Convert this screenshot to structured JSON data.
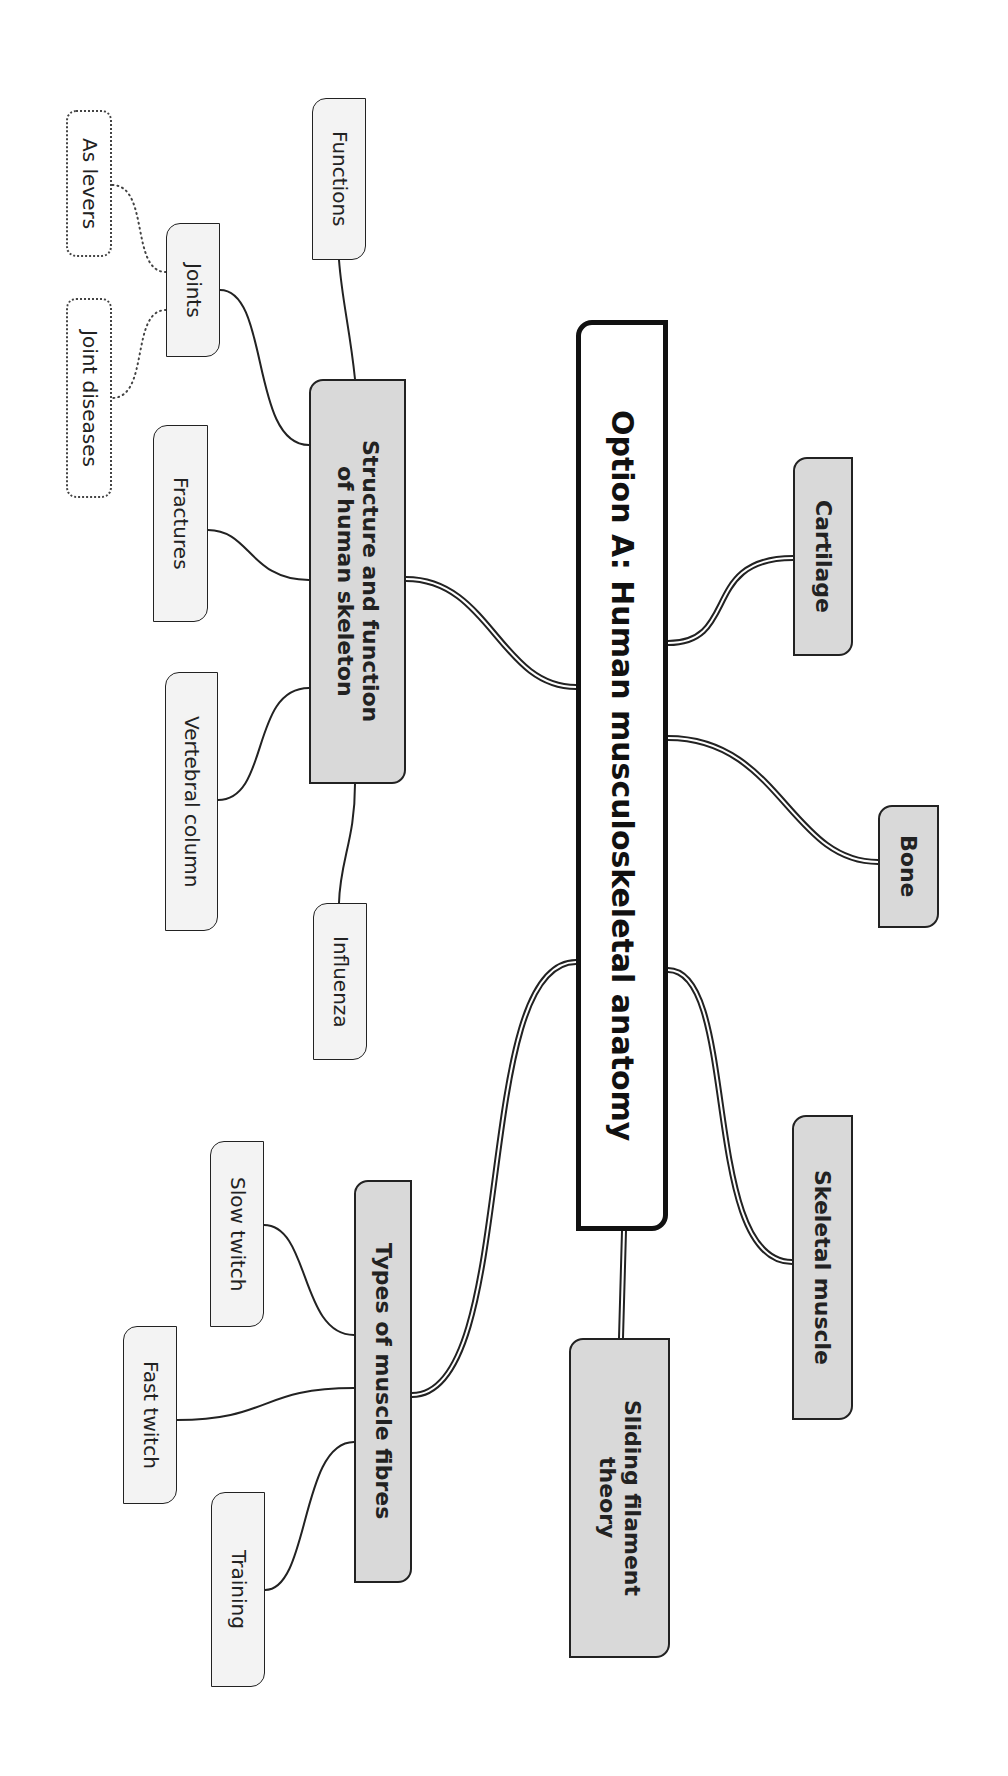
{
  "title": "Option A: Human musculoskeletal anatomy",
  "orientation": "rotated 90° clockwise",
  "colors": {
    "main_fill": "#ffffff",
    "branch_fill": "#d9d9d9",
    "leaf_fill": "#f3f3f3",
    "stroke": "#222222"
  },
  "nodes": {
    "main": {
      "label": "Option A: Human musculoskeletal anatomy",
      "x": 576,
      "y": 320,
      "w": 92,
      "h": 911
    },
    "cartilage": {
      "label": "Cartilage",
      "x": 793,
      "y": 457,
      "w": 60,
      "h": 199
    },
    "bone": {
      "label": "Bone",
      "x": 878,
      "y": 805,
      "w": 61,
      "h": 123
    },
    "skeletal_muscle": {
      "label": "Skeletal muscle",
      "x": 792,
      "y": 1115,
      "w": 61,
      "h": 305
    },
    "sliding_filament": {
      "label": "Sliding filament\ntheory",
      "x": 569,
      "y": 1338,
      "w": 101,
      "h": 320
    },
    "structure": {
      "label": "Structure and function\nof human skeleton",
      "x": 309,
      "y": 379,
      "w": 97,
      "h": 405
    },
    "types": {
      "label": "Types of muscle fibres",
      "x": 354,
      "y": 1180,
      "w": 58,
      "h": 403
    },
    "functions": {
      "label": "Functions",
      "x": 312,
      "y": 98,
      "w": 54,
      "h": 162
    },
    "joints": {
      "label": "Joints",
      "x": 166,
      "y": 223,
      "w": 54,
      "h": 134
    },
    "as_levers": {
      "label": "As levers",
      "x": 66,
      "y": 110,
      "w": 46,
      "h": 147
    },
    "joint_diseases": {
      "label": "Joint diseases",
      "x": 66,
      "y": 298,
      "w": 46,
      "h": 200
    },
    "fractures": {
      "label": "Fractures",
      "x": 153,
      "y": 425,
      "w": 55,
      "h": 197
    },
    "vertebral_column": {
      "label": "Vertebral column",
      "x": 165,
      "y": 672,
      "w": 53,
      "h": 259
    },
    "influenza": {
      "label": "Influenza",
      "x": 313,
      "y": 903,
      "w": 54,
      "h": 157
    },
    "slow_twitch": {
      "label": "Slow twitch",
      "x": 210,
      "y": 1141,
      "w": 54,
      "h": 186
    },
    "fast_twitch": {
      "label": "Fast twitch",
      "x": 123,
      "y": 1326,
      "w": 54,
      "h": 178
    },
    "training": {
      "label": "Training",
      "x": 211,
      "y": 1492,
      "w": 54,
      "h": 195
    }
  },
  "edges": [
    {
      "from": "main",
      "to": "cartilage",
      "style": "double",
      "path": "M668 643 C 740 643, 700 558, 793 558"
    },
    {
      "from": "main",
      "to": "bone",
      "style": "double",
      "path": "M668 738 C 780 738, 790 862, 878 862"
    },
    {
      "from": "main",
      "to": "skeletal_muscle",
      "style": "double",
      "path": "M668 970 C 740 970, 700 1262, 792 1262"
    },
    {
      "from": "main",
      "to": "sliding_filament",
      "style": "double",
      "path": "M624 1231 L 621 1338"
    },
    {
      "from": "main",
      "to": "structure",
      "style": "double",
      "path": "M576 687 C 500 687, 490 579, 406 579"
    },
    {
      "from": "main",
      "to": "types",
      "style": "double",
      "path": "M576 962 C 470 962, 520 1395, 412 1395"
    },
    {
      "from": "structure",
      "to": "functions",
      "style": "solid",
      "path": "M355 379 C 350 330, 342 300, 339 260"
    },
    {
      "from": "structure",
      "to": "joints",
      "style": "solid",
      "path": "M309 445 C 250 445, 270 290, 220 290"
    },
    {
      "from": "structure",
      "to": "fractures",
      "style": "solid",
      "path": "M309 580 C 250 580, 250 530, 208 530"
    },
    {
      "from": "structure",
      "to": "vertebral_column",
      "style": "solid",
      "path": "M309 688 C 250 688, 270 800, 218 800"
    },
    {
      "from": "structure",
      "to": "influenza",
      "style": "solid",
      "path": "M355 784 C 355 840, 340 860, 339 903"
    },
    {
      "from": "joints",
      "to": "as_levers",
      "style": "dotted",
      "path": "M166 272 C 130 272, 150 185, 112 185"
    },
    {
      "from": "joints",
      "to": "joint_diseases",
      "style": "dotted",
      "path": "M166 310 C 130 310, 150 398, 112 398"
    },
    {
      "from": "types",
      "to": "slow_twitch",
      "style": "solid",
      "path": "M354 1335 C 300 1335, 310 1225, 264 1225"
    },
    {
      "from": "types",
      "to": "fast_twitch",
      "style": "solid",
      "path": "M354 1388 C 260 1388, 270 1420, 177 1420"
    },
    {
      "from": "types",
      "to": "training",
      "style": "solid",
      "path": "M354 1442 C 300 1442, 310 1590, 265 1590"
    }
  ]
}
